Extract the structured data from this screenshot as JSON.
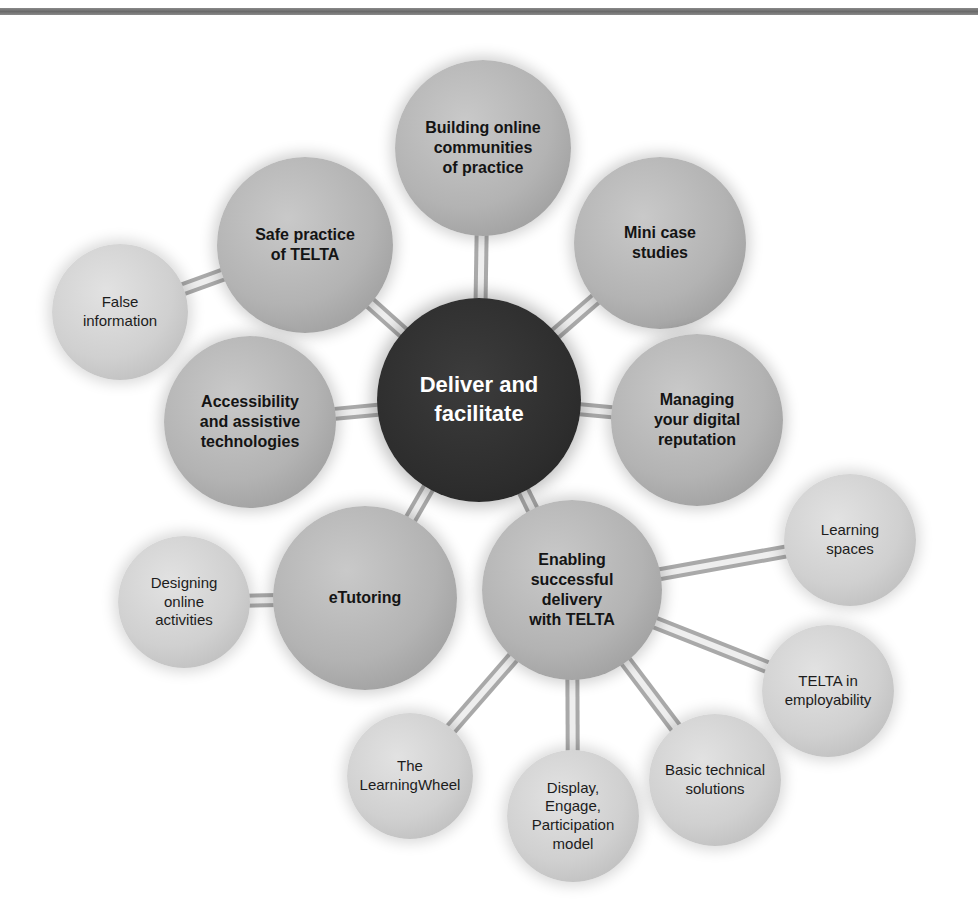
{
  "diagram": {
    "type": "hub-and-spoke concept map",
    "center": {
      "id": "deliver",
      "label": "Deliver and\nfacilitate",
      "cx": 479,
      "cy": 400,
      "r": 102,
      "color": "#2d2d2d"
    },
    "nodes": [
      {
        "id": "building",
        "label": "Building online\ncommunities\nof practice",
        "level": "primary",
        "cx": 483,
        "cy": 148,
        "r": 88,
        "parent": "deliver"
      },
      {
        "id": "mini",
        "label": "Mini case\nstudies",
        "level": "primary",
        "cx": 660,
        "cy": 243,
        "r": 86,
        "parent": "deliver"
      },
      {
        "id": "safe",
        "label": "Safe practice\nof TELTA",
        "level": "primary",
        "cx": 305,
        "cy": 245,
        "r": 88,
        "parent": "deliver"
      },
      {
        "id": "access",
        "label": "Accessibility\nand assistive\ntechnologies",
        "level": "primary",
        "cx": 250,
        "cy": 422,
        "r": 86,
        "parent": "deliver"
      },
      {
        "id": "managing",
        "label": "Managing\nyour digital\nreputation",
        "level": "primary",
        "cx": 697,
        "cy": 420,
        "r": 86,
        "parent": "deliver"
      },
      {
        "id": "etutoring",
        "label": "eTutoring",
        "level": "primary",
        "cx": 365,
        "cy": 598,
        "r": 92,
        "parent": "deliver"
      },
      {
        "id": "enabling",
        "label": "Enabling\nsuccessful\ndelivery\nwith TELTA",
        "level": "primary",
        "cx": 572,
        "cy": 590,
        "r": 90,
        "parent": "deliver"
      },
      {
        "id": "false",
        "label": "False\ninformation",
        "level": "secondary",
        "cx": 120,
        "cy": 312,
        "r": 68,
        "parent": "safe"
      },
      {
        "id": "designing",
        "label": "Designing\nonline\nactivities",
        "level": "secondary",
        "cx": 184,
        "cy": 602,
        "r": 66,
        "parent": "etutoring"
      },
      {
        "id": "learning",
        "label": "Learning\nspaces",
        "level": "secondary",
        "cx": 850,
        "cy": 540,
        "r": 66,
        "parent": "enabling"
      },
      {
        "id": "employ",
        "label": "TELTA in\nemployability",
        "level": "secondary",
        "cx": 828,
        "cy": 691,
        "r": 66,
        "parent": "enabling"
      },
      {
        "id": "wheel",
        "label": "The\nLearningWheel",
        "level": "secondary",
        "cx": 410,
        "cy": 776,
        "r": 63,
        "parent": "enabling"
      },
      {
        "id": "display",
        "label": "Display,\nEngage,\nParticipation\nmodel",
        "level": "secondary",
        "cx": 573,
        "cy": 816,
        "r": 66,
        "parent": "enabling"
      },
      {
        "id": "basic",
        "label": "Basic technical\nsolutions",
        "level": "secondary",
        "cx": 715,
        "cy": 780,
        "r": 66,
        "parent": "enabling"
      }
    ]
  }
}
